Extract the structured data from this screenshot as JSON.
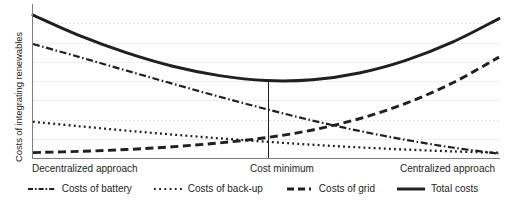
{
  "chart_data": {
    "type": "line",
    "title": "",
    "xlabel": "",
    "ylabel": "Costs of integrating renewables",
    "grid": true,
    "gridlines": 7,
    "legend_position": "bottom",
    "axis_ticks_numeric": false,
    "x_category_labels": [
      "Decentralized approach",
      "Cost minimum",
      "Centralized approach"
    ],
    "annotations": [
      {
        "name": "cost-minimum-marker",
        "label": "Cost minimum",
        "x": 0.505,
        "description": "vertical drop line from total costs minimum to x-axis"
      }
    ],
    "x": [
      0.0,
      0.1,
      0.2,
      0.3,
      0.4,
      0.5,
      0.6,
      0.7,
      0.8,
      0.9,
      1.0
    ],
    "xlim": [
      0,
      1
    ],
    "ylim": [
      0,
      1
    ],
    "series": [
      {
        "name": "Costs of battery",
        "style": "dash-dot",
        "values": [
          0.74,
          0.655,
          0.568,
          0.482,
          0.398,
          0.318,
          0.243,
          0.176,
          0.118,
          0.068,
          0.028
        ]
      },
      {
        "name": "Costs of back-up",
        "style": "dotted",
        "values": [
          0.235,
          0.206,
          0.178,
          0.152,
          0.128,
          0.106,
          0.086,
          0.069,
          0.055,
          0.043,
          0.034
        ]
      },
      {
        "name": "Costs of grid",
        "style": "dashed",
        "values": [
          0.035,
          0.043,
          0.055,
          0.073,
          0.098,
          0.132,
          0.182,
          0.255,
          0.355,
          0.487,
          0.655
        ]
      },
      {
        "name": "Total costs",
        "style": "solid",
        "values": [
          0.928,
          0.794,
          0.684,
          0.596,
          0.535,
          0.503,
          0.508,
          0.552,
          0.634,
          0.752,
          0.905
        ]
      }
    ]
  },
  "legend": {
    "items": [
      {
        "label": "Costs of battery",
        "style": "dash-dot"
      },
      {
        "label": "Costs of back-up",
        "style": "dotted"
      },
      {
        "label": "Costs of grid",
        "style": "dashed"
      },
      {
        "label": "Total costs",
        "style": "solid"
      }
    ]
  },
  "colors": {
    "ink": "#231f20",
    "gridline": "#d9d9d9",
    "axis": "#7f7f7f",
    "background": "#ffffff"
  }
}
